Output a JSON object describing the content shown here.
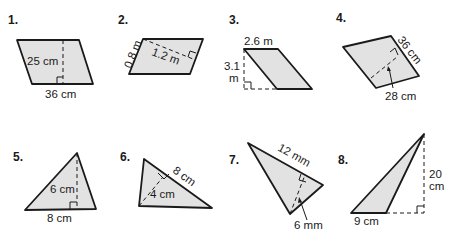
{
  "problems": [
    {
      "number": "1.",
      "shape": "parallelogram",
      "labels": {
        "height": "25 cm",
        "base": "36 cm"
      }
    },
    {
      "number": "2.",
      "shape": "parallelogram",
      "labels": {
        "side": "0.8 m",
        "height": "1.2 m"
      }
    },
    {
      "number": "3.",
      "shape": "parallelogram",
      "labels": {
        "base": "2.6 m",
        "height_line1": "3.1",
        "height_line2": "m"
      }
    },
    {
      "number": "4.",
      "shape": "parallelogram",
      "labels": {
        "base": "36 cm",
        "height": "28 cm"
      }
    },
    {
      "number": "5.",
      "shape": "triangle",
      "labels": {
        "height": "6 cm",
        "base": "8 cm"
      }
    },
    {
      "number": "6.",
      "shape": "triangle",
      "labels": {
        "base": "8 cm",
        "height": "4 cm"
      }
    },
    {
      "number": "7.",
      "shape": "triangle",
      "labels": {
        "base": "12 mm",
        "height": "6 mm"
      }
    },
    {
      "number": "8.",
      "shape": "triangle",
      "labels": {
        "base": "9 cm",
        "height_line1": "20",
        "height_line2": "cm"
      }
    }
  ],
  "colors": {
    "fill": "#e2e2e2",
    "stroke": "#1a1a1a"
  }
}
